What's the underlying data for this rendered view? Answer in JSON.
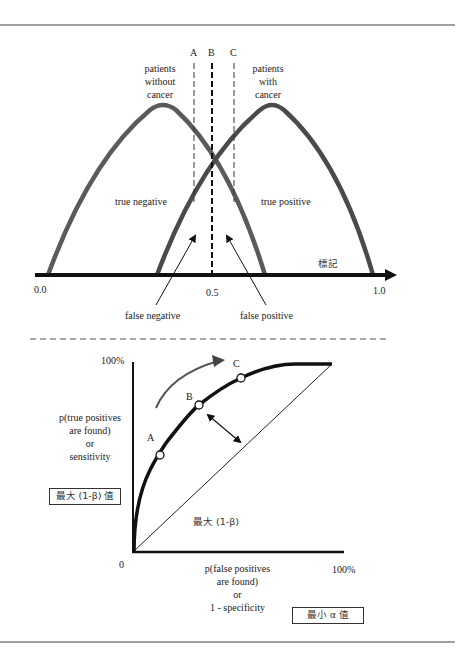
{
  "top_diagram": {
    "threshold_labels": [
      "A",
      "B",
      "C"
    ],
    "group_without": [
      "patients",
      "without",
      "cancer"
    ],
    "group_with": [
      "patients",
      "with",
      "cancer"
    ],
    "region_true_negative": "true negative",
    "region_true_positive": "true positive",
    "arrow_false_negative": "false negative",
    "arrow_false_positive": "false positive",
    "axis_label": "標記",
    "axis_ticks": [
      "0.0",
      "0.5",
      "1.0"
    ]
  },
  "roc_diagram": {
    "y_top_tick": "100%",
    "y_label": [
      "p(true positives",
      "are found)",
      "or",
      "sensitivity"
    ],
    "y_box_label": "最大 (1-β) 值",
    "curve_point_labels": [
      "A",
      "B",
      "C"
    ],
    "inner_label": "最大 (1-β)",
    "origin_tick": "0",
    "x_right_tick": "100%",
    "x_label": [
      "p(false positives",
      "are found)",
      "or",
      "1 - specificity"
    ],
    "x_box_label": "最小 α 值"
  },
  "colors": {
    "rule": "#a0a0a0",
    "distribution_curve": "#555555",
    "axis": "#111111"
  }
}
